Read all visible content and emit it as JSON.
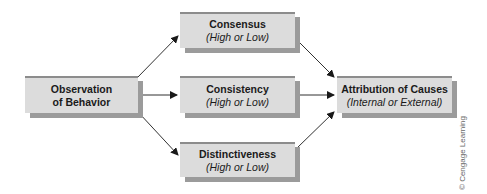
{
  "diagram": {
    "nodes": {
      "observation": {
        "title_line1": "Observation",
        "title_line2": "of Behavior"
      },
      "consensus": {
        "title": "Consensus",
        "subtitle": "(High or Low)"
      },
      "consistency": {
        "title": "Consistency",
        "subtitle": "(High or Low)"
      },
      "distinctiveness": {
        "title": "Distinctiveness",
        "subtitle": "(High or Low)"
      },
      "attribution": {
        "title": "Attribution of Causes",
        "subtitle": "(Internal or External)"
      }
    },
    "edges": [
      {
        "from": "observation",
        "to": "consensus"
      },
      {
        "from": "observation",
        "to": "consistency"
      },
      {
        "from": "observation",
        "to": "distinctiveness"
      },
      {
        "from": "consensus",
        "to": "attribution"
      },
      {
        "from": "consistency",
        "to": "attribution"
      },
      {
        "from": "distinctiveness",
        "to": "attribution"
      }
    ],
    "colors": {
      "box_fill": "#dcdcdc",
      "box_top_border": "#8c8c8c",
      "box_shadow": "#9b9b9b",
      "arrow": "#1a1a1a"
    },
    "copyright": "© Cengage Learning"
  }
}
